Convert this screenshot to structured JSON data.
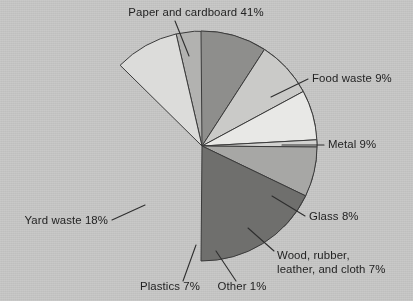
{
  "chart_data": {
    "type": "pie",
    "title": "",
    "subtitle": "",
    "xlabel": "",
    "ylabel": "",
    "legend_position": "none",
    "grid": false,
    "units": "percent",
    "total": 100,
    "categories": [
      "Paper and cardboard",
      "Food waste",
      "Metal",
      "Glass",
      "Wood, rubber, leather, and cloth",
      "Other",
      "Plastics",
      "Yard waste"
    ],
    "values": [
      41,
      9,
      9,
      8,
      7,
      1,
      7,
      18
    ],
    "slices": [
      {
        "name": "Paper and cardboard",
        "value": 41,
        "label": "Paper and cardboard 41%",
        "label_lines": [
          "Paper and cardboard 41%"
        ],
        "color": "#b2b2b0",
        "start_angle": -13,
        "end_angle": 134.6,
        "label_x": 196,
        "label_y": 16,
        "label_anchor": "middle",
        "leader": [
          175,
          21,
          189,
          56
        ]
      },
      {
        "name": "Food waste",
        "value": 9,
        "label": "Food waste 9%",
        "label_lines": [
          "Food waste 9%"
        ],
        "color": "#dcdcda",
        "start_angle": -13,
        "end_angle": -45.4,
        "label_x": 312,
        "label_y": 82,
        "label_anchor": "start",
        "leader": [
          308,
          79,
          271,
          97
        ]
      },
      {
        "name": "Metal",
        "value": 9,
        "label": "Metal 9%",
        "label_lines": [
          "Metal 9%"
        ],
        "color": "#8e8e8c",
        "start_angle": -0.5,
        "end_angle": 32.9,
        "label_x": 328,
        "label_y": 148,
        "label_anchor": "start",
        "leader": [
          324,
          145,
          282,
          145
        ]
      },
      {
        "name": "Glass",
        "value": 8,
        "label": "Glass 8%",
        "label_lines": [
          "Glass 8%"
        ],
        "color": "#cacac8",
        "start_angle": 32.9,
        "end_angle": 61.7,
        "label_x": 309,
        "label_y": 220,
        "label_anchor": "start",
        "leader": [
          305,
          216,
          272,
          196
        ]
      },
      {
        "name": "Wood, rubber, leather, and cloth",
        "value": 7,
        "label": "Wood, rubber, leather, and cloth 7%",
        "label_lines": [
          "Wood, rubber,",
          "leather, and cloth 7%"
        ],
        "color": "#e8e8e6",
        "start_angle": 61.7,
        "end_angle": 86.9,
        "label_x": 277,
        "label_y": 259,
        "label_anchor": "start",
        "leader": [
          274,
          251,
          248,
          228
        ]
      },
      {
        "name": "Other",
        "value": 1,
        "label": "Other 1%",
        "label_lines": [
          "Other 1%"
        ],
        "color": "#d2d2d0",
        "start_angle": 86.9,
        "end_angle": 90.5,
        "label_x": 242,
        "label_y": 290,
        "label_anchor": "middle",
        "leader": [
          236,
          281,
          216,
          251
        ]
      },
      {
        "name": "Plastics",
        "value": 7,
        "label": "Plastics 7%",
        "label_lines": [
          "Plastics 7%"
        ],
        "color": "#a7a7a5",
        "start_angle": 90.5,
        "end_angle": 115.7,
        "label_x": 170,
        "label_y": 290,
        "label_anchor": "middle",
        "leader": [
          183,
          281,
          196,
          245
        ]
      },
      {
        "name": "Yard waste",
        "value": 18,
        "label": "Yard waste 18%",
        "label_lines": [
          "Yard waste 18%"
        ],
        "color": "#6f6f6d",
        "start_angle": 115.7,
        "end_angle": 180.5,
        "label_x": 108,
        "label_y": 224,
        "label_anchor": "end",
        "leader": [
          112,
          220,
          145,
          205
        ]
      }
    ],
    "geometry": {
      "cx": 202,
      "cy": 146,
      "r": 115
    },
    "colors": {
      "background": "#c9c9c8",
      "outline": "#3b3b3b",
      "text": "#232323"
    }
  }
}
